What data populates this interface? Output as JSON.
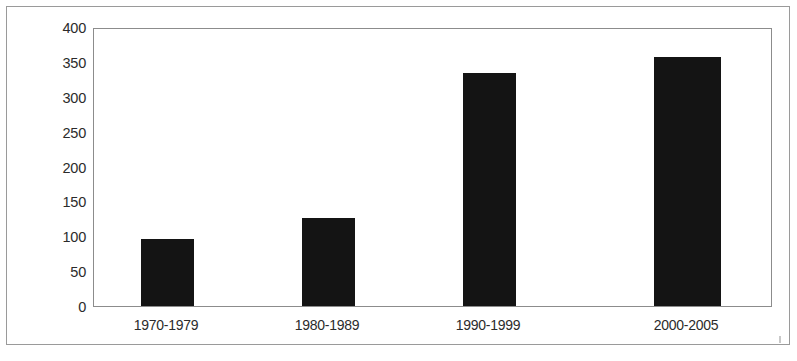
{
  "chart_data": {
    "type": "bar",
    "title": "",
    "subtitle": "",
    "xlabel": "",
    "ylabel": "Number of Reports",
    "categories": [
      "1970-1979",
      "1980-1989",
      "1990-1999",
      "2000-2005"
    ],
    "values": [
      96,
      126,
      334,
      357
    ],
    "series": [
      {
        "name": "Number of Reports",
        "values": [
          96,
          126,
          334,
          357
        ]
      }
    ],
    "ylim": [
      0,
      400
    ],
    "y_ticks": [
      0,
      50,
      100,
      150,
      200,
      250,
      300,
      350,
      400
    ],
    "y_tick_labels": [
      "0",
      "50",
      "100",
      "150",
      "200",
      "250",
      "300",
      "350",
      "400"
    ],
    "grid": false,
    "legend": false,
    "legend_position": "none",
    "bar_color": "#141414",
    "plot_background": "#ffffff",
    "axis_color": "#8c8c8c",
    "frame_color": "#9a9a9a",
    "bar_geometry": [
      {
        "category": "1970-1979",
        "value": 96,
        "left_px": 47,
        "width_px": 53
      },
      {
        "category": "1980-1989",
        "value": 126,
        "left_px": 208,
        "width_px": 53
      },
      {
        "category": "1990-1999",
        "value": 334,
        "left_px": 369,
        "width_px": 53
      },
      {
        "category": "2000-2005",
        "value": 357,
        "left_px": 560,
        "width_px": 67
      }
    ],
    "category_label_centers_px": [
      73,
      234,
      395,
      593
    ]
  }
}
